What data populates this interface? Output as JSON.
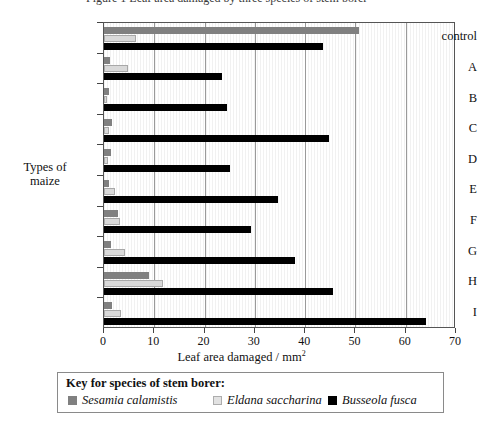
{
  "caption": {
    "text": "Figure 1  Leaf area damaged by three species of stem borer"
  },
  "chart_data": {
    "type": "bar",
    "orientation": "horizontal",
    "title": "",
    "xlabel": "Leaf area damaged / mm2",
    "xlabel_main": "Leaf area damaged / mm",
    "xlabel_sup": "2",
    "ylabel": "Types of maize",
    "ylabel_line1": "Types of",
    "ylabel_line2": "maize",
    "categories": [
      "control",
      "A",
      "B",
      "C",
      "D",
      "E",
      "F",
      "G",
      "H",
      "I"
    ],
    "xlim": [
      0,
      70
    ],
    "xticks": [
      0,
      10,
      20,
      30,
      40,
      50,
      60,
      70
    ],
    "xtick_labels": [
      "0",
      "10",
      "20",
      "30",
      "40",
      "50",
      "60",
      "70"
    ],
    "grid": "vertical-major",
    "legend_position": "below-plot",
    "series": [
      {
        "name": "Sesamia calamistis",
        "color": "#808080",
        "values": [
          50.7,
          1.2,
          1.0,
          1.6,
          1.3,
          1.0,
          2.8,
          1.4,
          9.0,
          1.6
        ]
      },
      {
        "name": "Eldana saccharina",
        "color": "#d9d9d9",
        "values": [
          6.3,
          4.7,
          0.6,
          1.0,
          0.8,
          2.2,
          3.2,
          4.2,
          11.8,
          3.3
        ]
      },
      {
        "name": "Busseola fusca",
        "color": "#000000",
        "values": [
          43.5,
          23.5,
          24.5,
          44.7,
          25.0,
          34.6,
          29.2,
          38.0,
          45.6,
          64.0
        ]
      }
    ]
  },
  "legend": {
    "title": "Key for species of stem borer:",
    "items": [
      {
        "label": "Sesamia calamistis",
        "color": "#808080",
        "swatch": "sesamia"
      },
      {
        "label": "Eldana saccharina",
        "color": "#d9d9d9",
        "swatch": "eldana"
      },
      {
        "label": "Busseola fusca",
        "color": "#000000",
        "swatch": "busseola"
      }
    ]
  }
}
